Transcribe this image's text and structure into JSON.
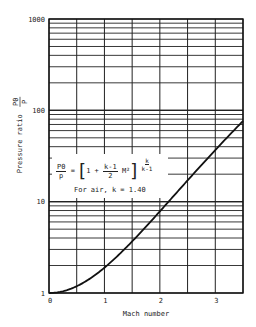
{
  "chart_data": {
    "type": "line",
    "title": "",
    "xlabel": "Mach number",
    "ylabel": "Pressure ratio p0/p",
    "ylabel_text": "Pressure ratio",
    "ylabel_fraction": {
      "num": "P0",
      "den": "P"
    },
    "xscale": "linear",
    "yscale": "log",
    "xlim": [
      0,
      3.5
    ],
    "ylim": [
      1,
      1000
    ],
    "x_ticks": [
      "0",
      "1",
      "2",
      "3"
    ],
    "y_ticks": [
      "1",
      "10",
      "100",
      "1000"
    ],
    "grid": true,
    "legend": null,
    "series": [
      {
        "name": "p0/p (k = 1.40)",
        "x": [
          0,
          0.25,
          0.5,
          0.75,
          1.0,
          1.25,
          1.5,
          1.75,
          2.0,
          2.25,
          2.5,
          2.75,
          3.0,
          3.25,
          3.5
        ],
        "y": [
          1.0,
          1.044,
          1.186,
          1.452,
          1.893,
          2.585,
          3.671,
          5.327,
          7.824,
          11.56,
          17.09,
          25.14,
          36.73,
          53.2,
          76.27
        ]
      }
    ],
    "annotations": {
      "formula_lhs_num": "P0",
      "formula_lhs_den": "p",
      "formula_eq": "=",
      "formula_one": "1 +",
      "formula_k_num": "k-1",
      "formula_k_den": "2",
      "formula_m2": "M²",
      "formula_exp_num": "k",
      "formula_exp_den": "k-1",
      "note": "For air, k = 1.40"
    }
  }
}
